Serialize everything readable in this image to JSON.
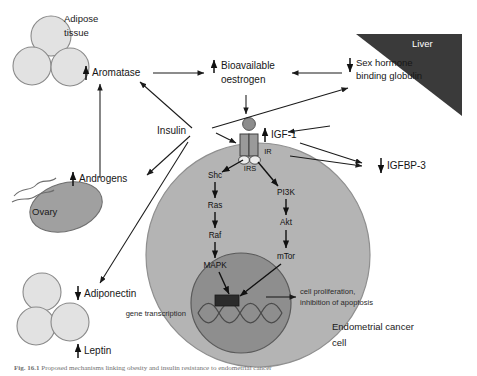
{
  "figure": {
    "caption_prefix": "Fig. 16.1",
    "caption_text": "Proposed mechanisms linking obesity and insulin resistance to endometrial cancer",
    "background_color": "#ffffff"
  },
  "colors": {
    "adipocyte_fill": "#e2e2e2",
    "adipocyte_stroke": "#8a8a8a",
    "ovary_fill": "#a0a0a0",
    "ovary_stroke": "#6e6e6e",
    "liver_fill": "#3a3a3a",
    "cell_cytoplasm": "#b4b4b4",
    "cell_stroke": "#8f8f8f",
    "nucleus_fill": "#8e8e8e",
    "nucleus_stroke": "#5a5a5a",
    "receptor_fill": "#9a9a9a",
    "receptor_stroke": "#4a4a4a",
    "ligand_fill": "#8c8c8c",
    "transcription_box": "#2b2b2b",
    "dna_stroke": "#4d4d4d",
    "arrow_color": "#1a1a1a",
    "text_color": "#161616"
  },
  "organs": {
    "adipose": {
      "label_line1": "Adipose",
      "label_line2": "tissue",
      "name": "Adipose tissue"
    },
    "ovary": {
      "label": "Ovary"
    },
    "liver": {
      "label": "Liver"
    },
    "cancer_cell": {
      "label_line1": "Endometrial cancer",
      "label_line2": "cell",
      "name": "Endometrial cancer cell"
    },
    "adipocyte_cluster_bottom": {
      "name": "adipocyte cluster"
    }
  },
  "nodes": {
    "aromatase": {
      "arrow": "up",
      "label": "Aromatase"
    },
    "bioavailable_oestrogen": {
      "arrow": "up",
      "label_line1": "Bioavailable",
      "label_line2": "oestrogen"
    },
    "shbg": {
      "arrow": "down",
      "label_line1": "Sex hormone",
      "label_line2": "binding globulin"
    },
    "insulin": {
      "arrow": "none",
      "label": "Insulin"
    },
    "igf1": {
      "arrow": "up",
      "label": "IGF-1"
    },
    "igfbp3": {
      "arrow": "down",
      "label": "IGFBP-3"
    },
    "androgens": {
      "arrow": "up",
      "label": "Androgens"
    },
    "adiponectin": {
      "arrow": "down",
      "label": "Adiponectin"
    },
    "leptin": {
      "arrow": "up",
      "label": "Leptin"
    }
  },
  "receptor": {
    "ir_label": "IR",
    "irs_label": "IRS"
  },
  "pathways": {
    "mapk_branch": [
      "Shc",
      "Ras",
      "Raf",
      "MAPK"
    ],
    "pi3k_branch": [
      "PI3K",
      "Akt",
      "mTor"
    ]
  },
  "nucleus": {
    "gene_transcription_label": "gene transcription",
    "outcome_line1": "cell proliferation,",
    "outcome_line2": "inhibition of apoptosis"
  },
  "icons": {
    "up_arrow": "increase-arrow-icon",
    "down_arrow": "decrease-arrow-icon",
    "dna_helix": "dna-helix-icon",
    "receptor": "membrane-receptor-icon",
    "ligand": "ligand-icon"
  }
}
